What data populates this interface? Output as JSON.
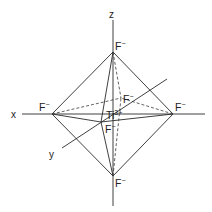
{
  "diagram": {
    "axes": {
      "x": "x",
      "y": "y",
      "z": "z"
    },
    "center_ion": {
      "symbol": "Ti",
      "charge": "3+"
    },
    "ligands": {
      "top": {
        "symbol": "F",
        "charge": "−"
      },
      "bottom": {
        "symbol": "F",
        "charge": "−"
      },
      "left": {
        "symbol": "F",
        "charge": "−"
      },
      "right": {
        "symbol": "F",
        "charge": "−"
      },
      "back": {
        "symbol": "F",
        "charge": "−"
      },
      "front": {
        "symbol": "F",
        "charge": "−"
      }
    },
    "colors": {
      "line": "#2a2a2a",
      "text": "#222222",
      "background": "#ffffff"
    }
  }
}
